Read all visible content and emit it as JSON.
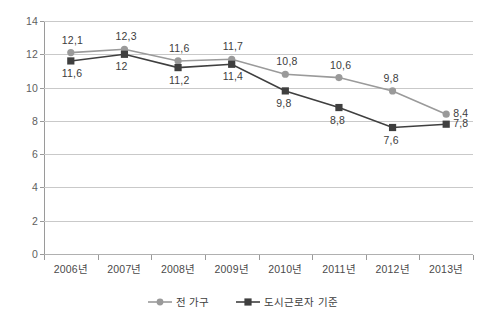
{
  "chart_data": {
    "type": "line",
    "title": "",
    "subtitle": "",
    "xlabel": "",
    "ylabel": "",
    "categories": [
      "2006년",
      "2007년",
      "2008년",
      "2009년",
      "2010년",
      "2011년",
      "2012년",
      "2013년"
    ],
    "ylim": [
      0,
      14
    ],
    "ytick_step": 2,
    "ytick_labels": [
      "14",
      "12",
      "10",
      "8",
      "6",
      "4",
      "2",
      "0"
    ],
    "ytick_values": [
      14,
      12,
      10,
      8,
      6,
      4,
      2,
      0
    ],
    "grid": "horizontal",
    "legend_position": "bottom-center",
    "decimal_separator": ",",
    "series": [
      {
        "name": "전 가구",
        "color": "#9a9a9a",
        "marker": "circle",
        "label_position": "above",
        "values": [
          12.1,
          12.3,
          11.6,
          11.7,
          10.8,
          10.6,
          9.8,
          8.4
        ],
        "labels": [
          "12,1",
          "12,3",
          "11,6",
          "11,7",
          "10,8",
          "10,6",
          "9,8",
          "8,4"
        ]
      },
      {
        "name": "도시근로자 기준",
        "color": "#3f3f3f",
        "marker": "square",
        "label_position": "below",
        "values": [
          11.6,
          12.0,
          11.2,
          11.4,
          9.8,
          8.8,
          7.6,
          7.8
        ],
        "labels": [
          "11,6",
          "12",
          "11,2",
          "11,4",
          "9,8",
          "8,8",
          "7,6",
          "7,8"
        ]
      }
    ]
  },
  "legend": {
    "items": [
      {
        "label": "전 가구"
      },
      {
        "label": "도시근로자 기준"
      }
    ]
  }
}
